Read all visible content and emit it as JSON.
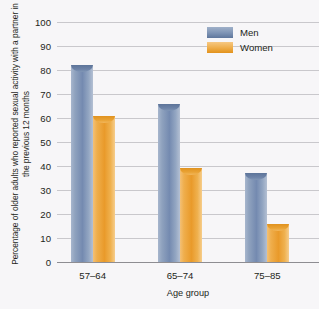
{
  "chart_data": {
    "type": "bar",
    "title": "",
    "subtitle": "",
    "xlabel": "Age group",
    "ylabel": "Percentage of older adults who reported sexual activity with a partner in the previous 12 months",
    "categories": [
      "57–64",
      "65–74",
      "75–85"
    ],
    "series": [
      {
        "name": "Men",
        "values": [
          82,
          66,
          37
        ],
        "color": "#7d93b4"
      },
      {
        "name": "Women",
        "values": [
          61,
          39,
          16
        ],
        "color": "#eeac48"
      }
    ],
    "ylim": [
      0,
      100
    ],
    "ytick_step": 10,
    "yticks": [
      "0",
      "10",
      "20",
      "30",
      "40",
      "50",
      "60",
      "70",
      "80",
      "90",
      "100"
    ],
    "grid": true,
    "legend_position": "top-right",
    "background_color": "#f7f6f8",
    "gridline_color": "#c9c8cc",
    "axis_color": "#8e8d92"
  },
  "legend": {
    "entries": [
      {
        "label": "Men"
      },
      {
        "label": "Women"
      }
    ]
  }
}
